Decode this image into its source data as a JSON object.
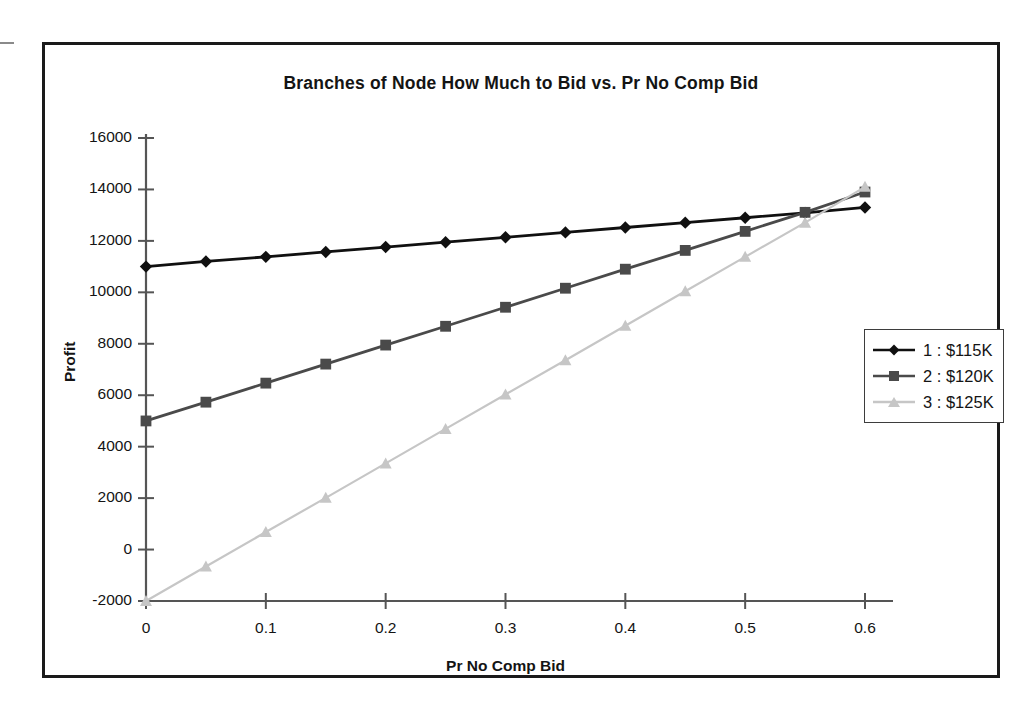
{
  "chart_data": {
    "type": "line",
    "title": "Branches of Node How Much to Bid vs. Pr No Comp Bid",
    "xlabel": "Pr No Comp Bid",
    "ylabel": "Profit",
    "x": [
      0,
      0.05,
      0.1,
      0.15,
      0.2,
      0.25,
      0.3,
      0.35,
      0.4,
      0.45,
      0.5,
      0.55,
      0.6
    ],
    "xlim": [
      0,
      0.6
    ],
    "ylim": [
      -2000,
      16000
    ],
    "xticks": [
      "0",
      "0.1",
      "0.2",
      "0.3",
      "0.4",
      "0.5",
      "0.6"
    ],
    "xtick_values": [
      0,
      0.1,
      0.2,
      0.3,
      0.4,
      0.5,
      0.6
    ],
    "yticks": [
      "-2000",
      "0",
      "2000",
      "4000",
      "6000",
      "8000",
      "10000",
      "12000",
      "14000",
      "16000"
    ],
    "ytick_values": [
      -2000,
      0,
      2000,
      4000,
      6000,
      8000,
      10000,
      12000,
      14000,
      16000
    ],
    "grid": false,
    "legend_position": "right",
    "series": [
      {
        "name": "1 : $115K",
        "color": "#101010",
        "marker": "diamond",
        "values": [
          11000,
          11200,
          11380,
          11570,
          11760,
          11950,
          12140,
          12330,
          12520,
          12710,
          12900,
          13090,
          13300
        ]
      },
      {
        "name": "2 : $120K",
        "color": "#4a4a4a",
        "marker": "square",
        "values": [
          5000,
          5730,
          6470,
          7210,
          7950,
          8680,
          9420,
          10160,
          10900,
          11630,
          12370,
          13110,
          13900
        ]
      },
      {
        "name": "3 : $125K",
        "color": "#c6c6c6",
        "marker": "triangle",
        "values": [
          -2000,
          -660,
          680,
          2010,
          3350,
          4690,
          6030,
          7360,
          8700,
          10040,
          11380,
          12710,
          14100
        ]
      }
    ]
  },
  "legend": {
    "items": [
      {
        "label": "1 : $115K"
      },
      {
        "label": "2 : $120K"
      },
      {
        "label": "3 : $125K"
      }
    ]
  }
}
